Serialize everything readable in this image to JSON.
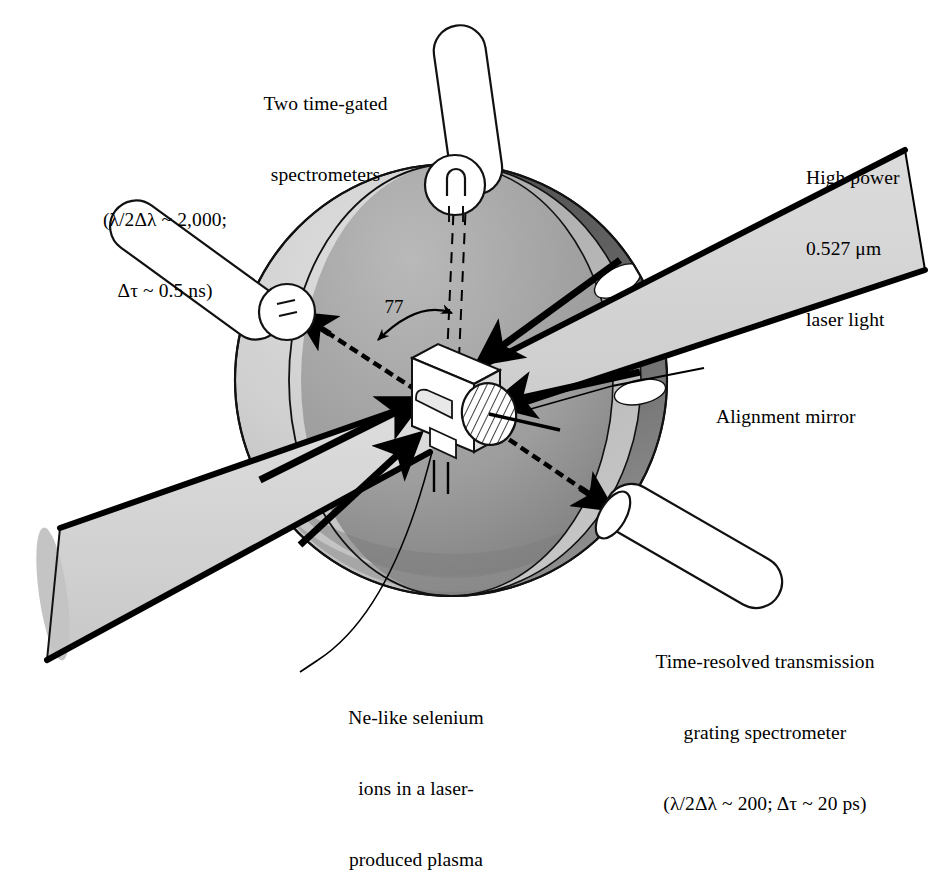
{
  "figure": {
    "background_color": "#ffffff",
    "line_color": "#000000"
  },
  "palette": {
    "ink": "#000000",
    "chamber_outer_light": "#c9c9c9",
    "chamber_outer_highlight": "#d8d8d8",
    "chamber_interior_mid": "#a8a8a8",
    "chamber_interior_dark": "#6f6f6f",
    "chamber_rim_dark": "#5e5e5e",
    "chamber_rim_mid": "#8a8a8a",
    "beam_fill": "#d5d5d5",
    "tube_fill": "#ffffff",
    "target_fill": "#ffffff",
    "target_shade": "#d0d0d0"
  },
  "annotations": {
    "top_spectrometers": {
      "name": "two-time-gated-spectrometers-label",
      "lines": [
        "Two time-gated",
        "spectrometers"
      ]
    },
    "left_resolution": {
      "name": "time-gated-resolution-label",
      "lines": [
        "(λ/2Δλ ~ 2,000;",
        "Δτ ~ 0.5 ns)"
      ]
    },
    "laser_light": {
      "name": "high-power-laser-light-label",
      "lines": [
        "High power",
        "0.527 μm",
        "laser light"
      ]
    },
    "alignment_mirror": {
      "name": "alignment-mirror-label",
      "lines": [
        "Alignment mirror"
      ]
    },
    "transmission_grating": {
      "name": "time-resolved-transmission-grating-label",
      "lines": [
        "Time-resolved transmission",
        "grating spectrometer",
        "(λ/2Δλ ~ 200; Δτ ~ 20 ps)"
      ]
    },
    "selenium_target": {
      "name": "ne-like-selenium-ions-label",
      "lines": [
        "Ne-like selenium",
        "ions in a laser-",
        "produced plasma"
      ]
    },
    "angle": {
      "name": "angle-value-label",
      "value": "77"
    }
  },
  "components": {
    "chamber": {
      "name": "vacuum-chamber-cutaway"
    },
    "top_tube": {
      "name": "top-spectrometer-tube"
    },
    "left_tube": {
      "name": "left-spectrometer-tube"
    },
    "bottom_right_tube": {
      "name": "transmission-grating-spectrometer-tube"
    },
    "upper_beam": {
      "name": "upper-laser-beam"
    },
    "lower_beam": {
      "name": "lower-laser-beam"
    },
    "target": {
      "name": "selenium-target-block"
    },
    "mirror": {
      "name": "alignment-mirror-disc"
    },
    "xray_left": {
      "name": "xray-emission-axis-left"
    },
    "xray_right": {
      "name": "xray-emission-axis-right"
    },
    "axis_dashed": {
      "name": "target-normal-dashed-axis"
    },
    "angle_arc": {
      "name": "angle-arc-arrow"
    }
  }
}
